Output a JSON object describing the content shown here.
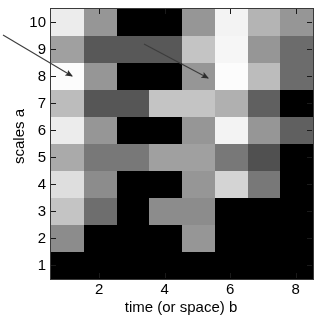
{
  "figure": {
    "background_color": "#ffffff",
    "plot_background_color": "#000000",
    "axis_color": "#1a1a1a"
  },
  "axes": {
    "y": {
      "title": "scales a",
      "ticks": [
        "1",
        "2",
        "3",
        "4",
        "5",
        "6",
        "7",
        "8",
        "9",
        "10"
      ],
      "min": 0.5,
      "max": 10.5
    },
    "x": {
      "title": "time (or space) b",
      "ticks": [
        "2",
        "4",
        "6",
        "8"
      ],
      "tick_values": [
        2,
        4,
        6,
        8
      ],
      "min": 0.5,
      "max": 8.5
    }
  },
  "annotations": {
    "arrows": [
      {
        "name": "arrow-left",
        "x1": 3,
        "y1": 35,
        "x2": 72,
        "y2": 76,
        "color": "#3c3c3c",
        "points_to": "bright ridge at scale a=8, b=1"
      },
      {
        "name": "arrow-right",
        "x1": 144,
        "y1": 44,
        "x2": 208,
        "y2": 78,
        "color": "#3c3c3c",
        "points_to": "bright ridge at scale a=8, b=5"
      }
    ]
  },
  "chart_data": {
    "type": "heatmap",
    "title": "",
    "xlabel": "time (or space) b",
    "ylabel": "scales a",
    "xlim": [
      0.5,
      8.5
    ],
    "ylim": [
      0.5,
      10.5
    ],
    "grid": false,
    "legend": "none",
    "colormap": "gray",
    "value_range": [
      0,
      255
    ],
    "x": [
      1,
      2,
      3,
      4,
      5,
      6,
      7,
      8
    ],
    "y": [
      1,
      2,
      3,
      4,
      5,
      6,
      7,
      8,
      9,
      10
    ],
    "comment": "Grayscale wavelet scalogram. Rows listed from scale a=10 (top) down to a=1 (bottom); each row holds 8 values for b=1..8 as 0-255 luminance.",
    "rows_top_to_bottom": [
      {
        "scale": 10,
        "values": [
          236,
          150,
          0,
          0,
          150,
          243,
          180,
          150
        ]
      },
      {
        "scale": 9,
        "values": [
          160,
          88,
          88,
          88,
          196,
          246,
          150,
          108
        ]
      },
      {
        "scale": 8,
        "values": [
          252,
          150,
          0,
          0,
          150,
          252,
          188,
          108
        ]
      },
      {
        "scale": 7,
        "values": [
          188,
          86,
          86,
          196,
          196,
          176,
          96,
          0
        ]
      },
      {
        "scale": 6,
        "values": [
          236,
          150,
          0,
          0,
          150,
          243,
          150,
          96
        ]
      },
      {
        "scale": 5,
        "values": [
          170,
          120,
          120,
          160,
          160,
          120,
          80,
          0
        ]
      },
      {
        "scale": 4,
        "values": [
          222,
          140,
          0,
          0,
          150,
          212,
          120,
          0
        ]
      },
      {
        "scale": 3,
        "values": [
          196,
          110,
          0,
          140,
          140,
          0,
          0,
          0
        ]
      },
      {
        "scale": 2,
        "values": [
          140,
          0,
          0,
          0,
          150,
          0,
          0,
          0
        ]
      },
      {
        "scale": 1,
        "values": [
          0,
          0,
          0,
          0,
          0,
          0,
          0,
          0
        ]
      }
    ]
  }
}
